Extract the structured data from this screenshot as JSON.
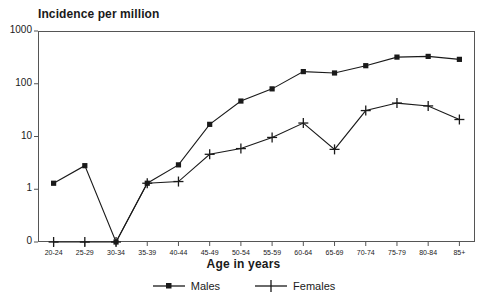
{
  "chart_data": {
    "type": "line",
    "title": "Incidence per million",
    "xlabel": "Age in years",
    "ylabel": "",
    "categories": [
      "20-24",
      "25-29",
      "30-34",
      "35-39",
      "40-44",
      "45-49",
      "50-54",
      "55-59",
      "60-64",
      "65-69",
      "70-74",
      "75-79",
      "80-84",
      "85+"
    ],
    "yticks": [
      0,
      1,
      10,
      100,
      1000
    ],
    "ytick_labels": [
      "0",
      "1",
      "10",
      "100",
      "1000"
    ],
    "yscale": "pseudo-log (0 placed one step below 1; decades evenly spaced)",
    "ylim": [
      0,
      1000
    ],
    "grid": false,
    "legend_position": "bottom-center",
    "series": [
      {
        "name": "Males",
        "marker": "square",
        "color": "#1a1a1a",
        "values": [
          1.3,
          2.8,
          0,
          1.3,
          2.9,
          17,
          47,
          80,
          170,
          160,
          220,
          320,
          330,
          290
        ]
      },
      {
        "name": "Females",
        "marker": "plus",
        "color": "#1a1a1a",
        "values": [
          0,
          0,
          0,
          1.3,
          1.4,
          4.6,
          5.9,
          9.6,
          18,
          5.7,
          31,
          43,
          38,
          21
        ]
      }
    ]
  },
  "legend": {
    "items": [
      {
        "label": "Males",
        "marker": "square"
      },
      {
        "label": "Females",
        "marker": "plus"
      }
    ]
  }
}
